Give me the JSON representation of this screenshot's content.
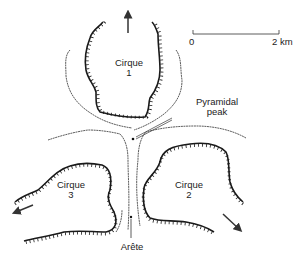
{
  "diagram": {
    "type": "glacial landforms map",
    "scale_bar": {
      "start_label": "0",
      "end_label": "2 km"
    },
    "cirques": [
      {
        "name": "Cirque",
        "number": "1",
        "flow_direction": "north"
      },
      {
        "name": "Cirque",
        "number": "2",
        "flow_direction": "south-east"
      },
      {
        "name": "Cirque",
        "number": "3",
        "flow_direction": "south-west"
      }
    ],
    "annotations": {
      "peak": "Pyramidal\npeak",
      "peak_line1": "Pyramidal",
      "peak_line2": "peak",
      "arete": "Arête"
    },
    "colors": {
      "line": "#1a1a1a",
      "background": "#ffffff"
    }
  }
}
